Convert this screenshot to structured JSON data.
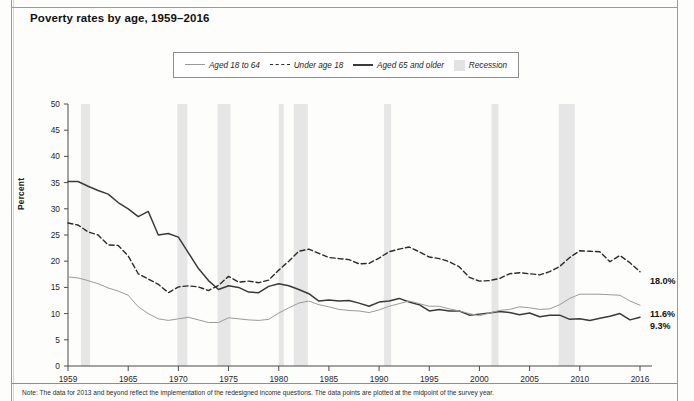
{
  "title": "Poverty rates by age, 1959–2016",
  "y_axis_label": "Percent",
  "note": "Note: The data for 2013 and beyond reflect the implementation of the redesigned income questions. The data points are plotted at the midpoint of the survey year.",
  "legend": {
    "items": [
      {
        "label": "Aged 18 to 64",
        "style": "solid-light",
        "color": "#9a9a9a"
      },
      {
        "label": "Under age 18",
        "style": "dashed",
        "color": "#2b2b2b"
      },
      {
        "label": "Aged 65 and older",
        "style": "solid-dark",
        "color": "#3a3a3a"
      },
      {
        "label": "Recession",
        "style": "band",
        "color": "#e2e2e2"
      }
    ]
  },
  "end_labels": [
    {
      "series": "Under age 18",
      "text": "18.0%",
      "value": 18.0
    },
    {
      "series": "Aged 18 to 64",
      "text": "11.6%",
      "value": 11.6
    },
    {
      "series": "Aged 65 and older",
      "text": "9.3%",
      "value": 9.3
    }
  ],
  "chart_data": {
    "type": "line",
    "title": "Poverty rates by age, 1959–2016",
    "xlabel": "",
    "ylabel": "Percent",
    "xlim": [
      1959,
      2016
    ],
    "ylim": [
      0,
      50
    ],
    "ytick_labels": [
      "0",
      "5",
      "10",
      "15",
      "20",
      "25",
      "30",
      "35",
      "40",
      "45",
      "50"
    ],
    "yticks": [
      0,
      5,
      10,
      15,
      20,
      25,
      30,
      35,
      40,
      45,
      50
    ],
    "xtick_labels": [
      "1959",
      "1965",
      "1970",
      "1975",
      "1980",
      "1985",
      "1990",
      "1995",
      "2000",
      "2005",
      "2010",
      "2016"
    ],
    "xticks": [
      1959,
      1965,
      1970,
      1975,
      1980,
      1985,
      1990,
      1995,
      2000,
      2005,
      2010,
      2016
    ],
    "grid": false,
    "legend_position": "top-center",
    "x": [
      1959,
      1960,
      1961,
      1962,
      1963,
      1964,
      1965,
      1966,
      1967,
      1968,
      1969,
      1970,
      1971,
      1972,
      1973,
      1974,
      1975,
      1976,
      1977,
      1978,
      1979,
      1980,
      1981,
      1982,
      1983,
      1984,
      1985,
      1986,
      1987,
      1988,
      1989,
      1990,
      1991,
      1992,
      1993,
      1994,
      1995,
      1996,
      1997,
      1998,
      1999,
      2000,
      2001,
      2002,
      2003,
      2004,
      2005,
      2006,
      2007,
      2008,
      2009,
      2010,
      2011,
      2012,
      2013,
      2014,
      2015,
      2016
    ],
    "series": [
      {
        "name": "Aged 65 and older",
        "style": "solid-dark",
        "color": "#3a3a3a",
        "values": [
          35.2,
          35.2,
          34.3,
          33.5,
          32.8,
          31.2,
          30.0,
          28.5,
          29.5,
          25.0,
          25.3,
          24.6,
          21.6,
          18.6,
          16.3,
          14.6,
          15.3,
          15.0,
          14.1,
          14.0,
          15.2,
          15.7,
          15.3,
          14.6,
          13.8,
          12.4,
          12.6,
          12.4,
          12.5,
          12.0,
          11.4,
          12.2,
          12.4,
          12.9,
          12.2,
          11.7,
          10.5,
          10.8,
          10.5,
          10.5,
          9.7,
          9.9,
          10.1,
          10.4,
          10.2,
          9.8,
          10.1,
          9.4,
          9.7,
          9.7,
          8.9,
          9.0,
          8.7,
          9.1,
          9.5,
          10.0,
          8.8,
          9.3
        ]
      },
      {
        "name": "Under age 18",
        "style": "dashed",
        "color": "#2b2b2b",
        "values": [
          27.3,
          26.9,
          25.6,
          25.0,
          23.1,
          23.0,
          21.0,
          17.6,
          16.6,
          15.6,
          14.0,
          15.1,
          15.3,
          15.1,
          14.4,
          15.4,
          17.1,
          16.0,
          16.2,
          15.9,
          16.4,
          18.3,
          20.0,
          21.9,
          22.3,
          21.5,
          20.7,
          20.5,
          20.3,
          19.5,
          19.6,
          20.6,
          21.8,
          22.3,
          22.7,
          21.8,
          20.8,
          20.5,
          19.9,
          18.9,
          16.9,
          16.2,
          16.3,
          16.7,
          17.6,
          17.8,
          17.6,
          17.4,
          18.0,
          19.0,
          20.7,
          22.0,
          21.9,
          21.8,
          19.9,
          21.1,
          19.7,
          18.0
        ]
      },
      {
        "name": "Aged 18 to 64",
        "style": "solid-light",
        "color": "#9a9a9a",
        "values": [
          17.0,
          16.8,
          16.3,
          15.7,
          14.9,
          14.3,
          13.5,
          11.3,
          10.0,
          9.0,
          8.7,
          9.0,
          9.3,
          8.8,
          8.3,
          8.3,
          9.2,
          9.0,
          8.8,
          8.7,
          8.9,
          10.1,
          11.1,
          12.0,
          12.4,
          11.7,
          11.3,
          10.8,
          10.6,
          10.5,
          10.2,
          10.7,
          11.4,
          11.9,
          12.4,
          11.9,
          11.4,
          11.4,
          10.9,
          10.5,
          10.0,
          9.6,
          10.1,
          10.6,
          10.8,
          11.3,
          11.1,
          10.8,
          10.9,
          11.7,
          12.9,
          13.7,
          13.7,
          13.7,
          13.6,
          13.5,
          12.4,
          11.6
        ]
      }
    ],
    "recessions": [
      {
        "start": 1960.3,
        "end": 1961.2
      },
      {
        "start": 1969.9,
        "end": 1970.9
      },
      {
        "start": 1973.9,
        "end": 1975.2
      },
      {
        "start": 1980.0,
        "end": 1980.5
      },
      {
        "start": 1981.5,
        "end": 1982.9
      },
      {
        "start": 1990.5,
        "end": 1991.2
      },
      {
        "start": 2001.2,
        "end": 2001.9
      },
      {
        "start": 2007.9,
        "end": 2009.5
      }
    ]
  }
}
